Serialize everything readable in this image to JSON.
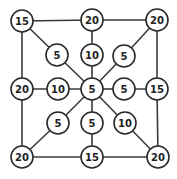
{
  "diagram": {
    "type": "graph",
    "node_radius": 11,
    "colors": {
      "stroke": "#2a2a2a",
      "fill": "#ffffff",
      "text": "#222222"
    },
    "nodes": [
      {
        "id": "tl",
        "label": "15",
        "x": 22,
        "y": 21
      },
      {
        "id": "t",
        "label": "20",
        "x": 92,
        "y": 20
      },
      {
        "id": "tr",
        "label": "20",
        "x": 157,
        "y": 20
      },
      {
        "id": "itl",
        "label": "5",
        "x": 57,
        "y": 55
      },
      {
        "id": "it",
        "label": "10",
        "x": 92,
        "y": 55
      },
      {
        "id": "itr",
        "label": "5",
        "x": 124,
        "y": 56
      },
      {
        "id": "l",
        "label": "20",
        "x": 22,
        "y": 89
      },
      {
        "id": "il",
        "label": "10",
        "x": 58,
        "y": 89
      },
      {
        "id": "c",
        "label": "5",
        "x": 92,
        "y": 89
      },
      {
        "id": "ir",
        "label": "5",
        "x": 124,
        "y": 89
      },
      {
        "id": "r",
        "label": "15",
        "x": 157,
        "y": 89
      },
      {
        "id": "ibl",
        "label": "5",
        "x": 58,
        "y": 123
      },
      {
        "id": "ib",
        "label": "5",
        "x": 92,
        "y": 123
      },
      {
        "id": "ibr",
        "label": "10",
        "x": 125,
        "y": 123
      },
      {
        "id": "bl",
        "label": "20",
        "x": 22,
        "y": 157
      },
      {
        "id": "b",
        "label": "15",
        "x": 92,
        "y": 157
      },
      {
        "id": "br",
        "label": "20",
        "x": 158,
        "y": 157
      }
    ],
    "edges": [
      [
        "tl",
        "t"
      ],
      [
        "t",
        "tr"
      ],
      [
        "tl",
        "l"
      ],
      [
        "l",
        "bl"
      ],
      [
        "bl",
        "b"
      ],
      [
        "b",
        "br"
      ],
      [
        "tr",
        "r"
      ],
      [
        "r",
        "br"
      ],
      [
        "tl",
        "itl"
      ],
      [
        "itl",
        "c"
      ],
      [
        "t",
        "it"
      ],
      [
        "it",
        "c"
      ],
      [
        "tr",
        "itr"
      ],
      [
        "itr",
        "c"
      ],
      [
        "l",
        "il"
      ],
      [
        "il",
        "c"
      ],
      [
        "r",
        "ir"
      ],
      [
        "ir",
        "c"
      ],
      [
        "bl",
        "ibl"
      ],
      [
        "ibl",
        "c"
      ],
      [
        "b",
        "ib"
      ],
      [
        "ib",
        "c"
      ],
      [
        "br",
        "ibr"
      ],
      [
        "ibr",
        "c"
      ]
    ]
  }
}
